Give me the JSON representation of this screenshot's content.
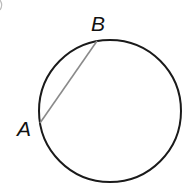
{
  "diagram": {
    "type": "circle-with-chord",
    "circle": {
      "cx": 110,
      "cy": 111,
      "r": 71,
      "stroke": "#1a1a1a",
      "stroke_width": 2
    },
    "chord": {
      "from": "A",
      "to": "B",
      "x1": 40,
      "y1": 123,
      "x2": 97,
      "y2": 41,
      "stroke": "#8a8a8a",
      "stroke_width": 1.6
    },
    "points": [
      {
        "name": "A",
        "label": "A",
        "x": 40,
        "y": 123
      },
      {
        "name": "B",
        "label": "B",
        "x": 97,
        "y": 41
      }
    ]
  },
  "labels": {
    "point_a": "A",
    "point_b": "B"
  }
}
